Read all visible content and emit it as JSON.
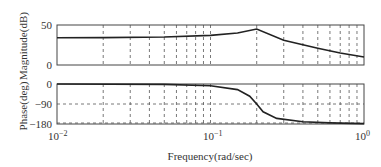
{
  "chart_data": [
    {
      "type": "line",
      "title": "",
      "xlabel": "Frequency(rad/sec)",
      "ylabel": "Magnitude(dB)",
      "xscale": "log",
      "xlim": [
        0.01,
        1
      ],
      "ylim": [
        0,
        50
      ],
      "yticks": [
        "0",
        "50"
      ],
      "grid": true,
      "series": [
        {
          "name": "magnitude",
          "x": [
            0.01,
            0.02,
            0.05,
            0.1,
            0.15,
            0.2,
            0.3,
            0.5,
            0.7,
            1.0
          ],
          "values": [
            34,
            34.2,
            35,
            37,
            40,
            45,
            31,
            21,
            15,
            10
          ]
        }
      ]
    },
    {
      "type": "line",
      "title": "",
      "xlabel": "Frequency(rad/sec)",
      "ylabel": "Phase(deg)",
      "xscale": "log",
      "xlim": [
        0.01,
        1
      ],
      "ylim": [
        -180,
        0
      ],
      "yticks": [
        "0",
        "-90",
        "-180"
      ],
      "xticks": [
        "10^-2",
        "10^-1",
        "10^0"
      ],
      "grid": true,
      "series": [
        {
          "name": "phase",
          "x": [
            0.01,
            0.05,
            0.1,
            0.15,
            0.18,
            0.2,
            0.22,
            0.27,
            0.4,
            0.6,
            1.0
          ],
          "values": [
            0,
            -2,
            -8,
            -25,
            -55,
            -90,
            -125,
            -155,
            -170,
            -175,
            -178
          ]
        }
      ]
    }
  ],
  "labels": {
    "mag_ylabel": "Magnitude(dB)",
    "phase_ylabel": "Phase(deg)",
    "xlabel": "Frequency(rad/sec)",
    "mag_ytick_top": "50",
    "mag_ytick_bottom": "0",
    "phase_ytick_top": "0",
    "phase_ytick_mid": "−90",
    "phase_ytick_bottom": "−180",
    "xtick_base": "10",
    "xtick_exp_0": "−2",
    "xtick_exp_1": "−1",
    "xtick_exp_2": "0"
  }
}
